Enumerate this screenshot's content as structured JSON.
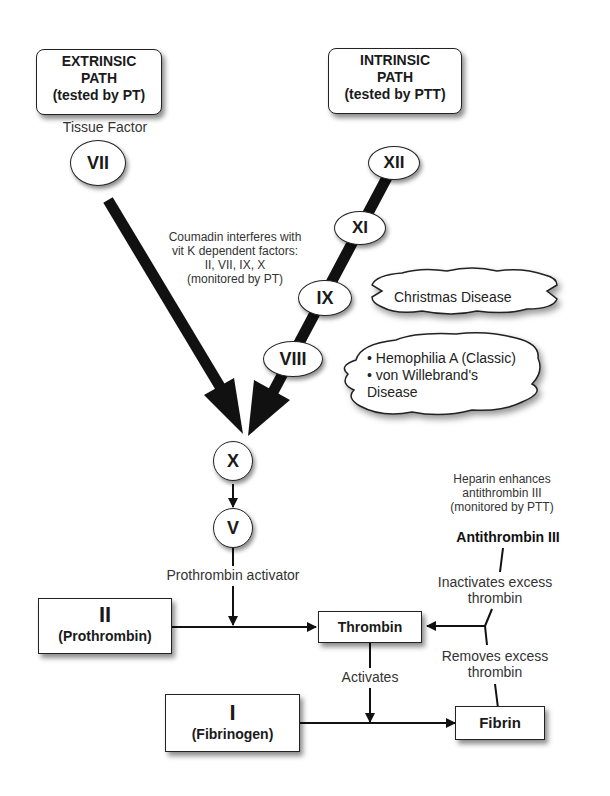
{
  "paths": {
    "extrinsic": {
      "line1": "EXTRINSIC",
      "line2": "PATH",
      "line3": "(tested by PT)"
    },
    "intrinsic": {
      "line1": "INTRINSIC",
      "line2": "PATH",
      "line3": "(tested by PTT)"
    }
  },
  "labels": {
    "tissue_factor": "Tissue Factor",
    "coumadin": [
      "Coumadin interferes with",
      "vit K dependent factors:",
      "II, VII, IX, X",
      "(monitored by PT)"
    ],
    "heparin": [
      "Heparin enhances",
      "antithrombin III",
      "(monitored by PTT)"
    ],
    "antithrombin": "Antithrombin III",
    "inactivates": [
      "Inactivates excess",
      "thrombin"
    ],
    "removes": [
      "Removes excess",
      "thrombin"
    ],
    "prothrombin_activator": "Prothrombin activator",
    "activates": "Activates"
  },
  "factors": {
    "vii": "VII",
    "xii": "XII",
    "xi": "XI",
    "ix": "IX",
    "viii": "VIII",
    "x": "X",
    "v": "V"
  },
  "clouds": {
    "christmas": "Christmas Disease",
    "hemophilia": [
      "• Hemophilia A (Classic)",
      "• von Willebrand's",
      "Disease"
    ]
  },
  "boxes": {
    "prothrombin": {
      "numeral": "II",
      "name": "(Prothrombin)"
    },
    "fibrinogen": {
      "numeral": "I",
      "name": "(Fibrinogen)"
    },
    "thrombin": "Thrombin",
    "fibrin": "Fibrin"
  }
}
